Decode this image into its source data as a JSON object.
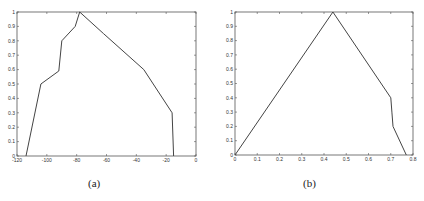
{
  "chart_data": [
    {
      "type": "line",
      "title": "",
      "caption": "(a)",
      "xlabel": "",
      "ylabel": "",
      "xlim": [
        -120,
        0
      ],
      "ylim": [
        0,
        1
      ],
      "xticks": [
        -120,
        -100,
        -80,
        -60,
        -40,
        -20,
        0
      ],
      "yticks": [
        0,
        0.1,
        0.2,
        0.3,
        0.4,
        0.5,
        0.6,
        0.7,
        0.8,
        0.9,
        1
      ],
      "grid": false,
      "series": [
        {
          "name": "membership",
          "x": [
            -114,
            -104,
            -92,
            -90,
            -81,
            -78,
            -62,
            -35,
            -16,
            -15
          ],
          "y": [
            0,
            0.5,
            0.59,
            0.8,
            0.9,
            1.0,
            0.85,
            0.6,
            0.3,
            0
          ]
        }
      ]
    },
    {
      "type": "line",
      "title": "",
      "caption": "(b)",
      "xlabel": "",
      "ylabel": "",
      "xlim": [
        0,
        0.8
      ],
      "ylim": [
        0,
        1
      ],
      "xticks": [
        0,
        0.1,
        0.2,
        0.3,
        0.4,
        0.5,
        0.6,
        0.7,
        0.8
      ],
      "yticks": [
        0,
        0.1,
        0.2,
        0.3,
        0.4,
        0.5,
        0.6,
        0.7,
        0.8,
        0.9,
        1
      ],
      "grid": false,
      "series": [
        {
          "name": "membership",
          "x": [
            0,
            0.44,
            0.7,
            0.705,
            0.71,
            0.77
          ],
          "y": [
            0,
            1.0,
            0.4,
            0.3,
            0.2,
            0
          ]
        }
      ]
    }
  ]
}
